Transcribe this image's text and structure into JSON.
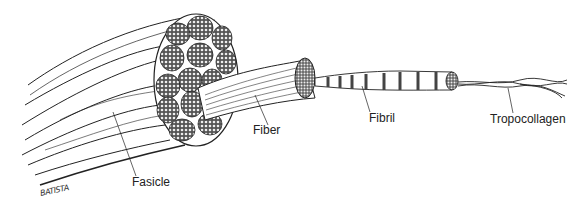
{
  "diagram": {
    "labels": {
      "fasicle": "Fasicle",
      "fiber": "Fiber",
      "fibril": "Fibril",
      "tropocollagen": "Tropocollagen"
    },
    "signature": "BATISTA",
    "colors": {
      "ink": "#222222",
      "background": "#ffffff"
    }
  }
}
